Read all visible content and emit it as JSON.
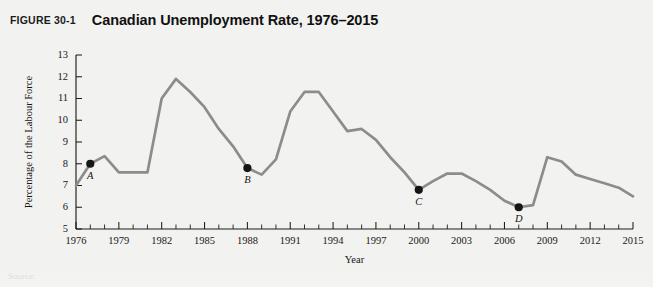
{
  "figure": {
    "number_label": "FIGURE 30-1",
    "title": "Canadian Unemployment Rate, 1976–2015"
  },
  "footer": {
    "partial_text": "Source:"
  },
  "colors": {
    "line": "#8c8c8c",
    "axis": "#1c1c1c",
    "marker": "#151515",
    "panel_background": "#f2f2f0"
  },
  "chart_data": {
    "type": "line",
    "title": "Canadian Unemployment Rate, 1976–2015",
    "xlabel": "Year",
    "ylabel": "Percentage of the Labour Force",
    "xlim": [
      1976,
      2015
    ],
    "ylim": [
      5,
      13
    ],
    "grid": false,
    "legend": "none",
    "y_ticks": [
      5,
      6,
      7,
      8,
      9,
      10,
      11,
      12,
      13
    ],
    "x_ticks": [
      1976,
      1979,
      1982,
      1985,
      1988,
      1991,
      1994,
      1997,
      2000,
      2003,
      2006,
      2009,
      2012,
      2015
    ],
    "x_tick_interval_minor": 1,
    "x": [
      1976,
      1977,
      1978,
      1979,
      1980,
      1981,
      1982,
      1983,
      1984,
      1985,
      1986,
      1987,
      1988,
      1989,
      1990,
      1991,
      1992,
      1993,
      1994,
      1995,
      1996,
      1997,
      1998,
      1999,
      2000,
      2001,
      2002,
      2003,
      2004,
      2005,
      2006,
      2007,
      2008,
      2009,
      2010,
      2011,
      2012,
      2013,
      2014,
      2015
    ],
    "values": [
      7.0,
      8.0,
      8.35,
      7.6,
      7.6,
      7.6,
      11.0,
      11.9,
      11.3,
      10.6,
      9.6,
      8.8,
      7.8,
      7.5,
      8.2,
      10.4,
      11.3,
      11.3,
      10.4,
      9.5,
      9.6,
      9.1,
      8.3,
      7.6,
      6.8,
      7.2,
      7.55,
      7.55,
      7.2,
      6.8,
      6.3,
      6.0,
      6.1,
      8.3,
      8.1,
      7.5,
      7.3,
      7.1,
      6.9,
      6.5
    ],
    "annotations": [
      {
        "label": "A",
        "x": 1977,
        "y": 8.0
      },
      {
        "label": "B",
        "x": 1988,
        "y": 7.8
      },
      {
        "label": "C",
        "x": 2000,
        "y": 6.8
      },
      {
        "label": "D",
        "x": 2007,
        "y": 6.0
      }
    ]
  }
}
